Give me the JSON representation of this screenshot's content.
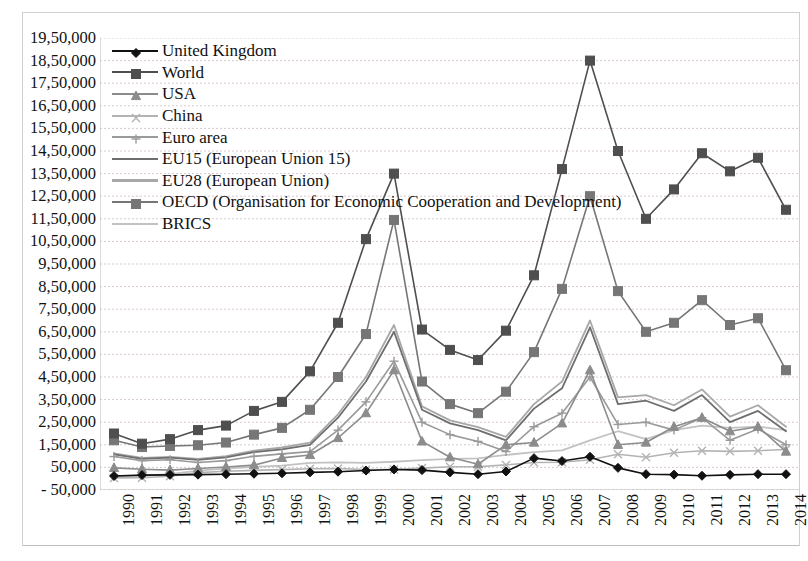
{
  "chart_data": {
    "type": "line",
    "title": "",
    "xlabel": "",
    "ylabel": "",
    "grid": true,
    "legend_position": "top-left-inside",
    "ylim": [
      -50000,
      1950000
    ],
    "ytick_step": 100000,
    "ytick_labels": [
      "19,50,000",
      "18,50,000",
      "17,50,000",
      "16,50,000",
      "15,50,000",
      "14,50,000",
      "13,50,000",
      "12,50,000",
      "11,50,000",
      "10,50,000",
      "9,50,000",
      "8,50,000",
      "7,50,000",
      "6,50,000",
      "5,50,000",
      "4,50,000",
      "3,50,000",
      "2,50,000",
      "1,50,000",
      "50,000",
      "- 50,000"
    ],
    "ytick_values": [
      1950000,
      1850000,
      1750000,
      1650000,
      1550000,
      1450000,
      1350000,
      1250000,
      1150000,
      1050000,
      950000,
      850000,
      750000,
      650000,
      550000,
      450000,
      350000,
      250000,
      150000,
      50000,
      -50000
    ],
    "categories": [
      "1990",
      "1991",
      "1992",
      "1993",
      "1994",
      "1995",
      "1996",
      "1997",
      "1998",
      "1999",
      "2000",
      "2001",
      "2002",
      "2003",
      "2004",
      "2005",
      "2006",
      "2007",
      "2008",
      "2009",
      "2010",
      "2011",
      "2012",
      "2013",
      "2014"
    ],
    "series": [
      {
        "name": "United Kingdom",
        "marker": "diamond",
        "color": "#111111",
        "values": [
          12000,
          16000,
          17000,
          18000,
          20000,
          22000,
          24000,
          28000,
          31000,
          36000,
          41000,
          38000,
          28000,
          20000,
          32000,
          91000,
          78000,
          97000,
          48000,
          20000,
          18000,
          13000,
          17000,
          20000,
          20000
        ]
      },
      {
        "name": "World",
        "marker": "square",
        "color": "#4f4f4f",
        "values": [
          200000,
          155000,
          175000,
          215000,
          235000,
          300000,
          340000,
          475000,
          690000,
          1060000,
          1350000,
          660000,
          570000,
          525000,
          655000,
          900000,
          1370000,
          1850000,
          1450000,
          1150000,
          1280000,
          1440000,
          1360000,
          1420000,
          1190000
        ]
      },
      {
        "name": "USA",
        "marker": "triangle",
        "color": "#8c8c8c",
        "values": [
          48000,
          42000,
          38000,
          45000,
          52000,
          60000,
          92000,
          105000,
          180000,
          290000,
          480000,
          165000,
          95000,
          64000,
          150000,
          160000,
          245000,
          480000,
          150000,
          160000,
          230000,
          270000,
          210000,
          230000,
          120000
        ]
      },
      {
        "name": "China",
        "marker": "x",
        "color": "#b3b3b3",
        "values": [
          3500,
          4400,
          11000,
          27000,
          33000,
          37000,
          40000,
          44000,
          45000,
          40000,
          41000,
          47000,
          53000,
          53000,
          61000,
          72000,
          73000,
          84000,
          108000,
          95000,
          115000,
          124000,
          121000,
          124000,
          129000
        ]
      },
      {
        "name": "Euro area",
        "marker": "plus",
        "color": "#9a9a9a",
        "values": [
          98000,
          80000,
          84000,
          72000,
          80000,
          99000,
          110000,
          120000,
          215000,
          340000,
          520000,
          250000,
          195000,
          165000,
          120000,
          230000,
          290000,
          450000,
          240000,
          250000,
          215000,
          270000,
          170000,
          220000,
          150000
        ]
      },
      {
        "name": "EU15 (European Union 15)",
        "marker": "none",
        "color": "#6e6e6e",
        "values": [
          108000,
          88000,
          93000,
          83000,
          94000,
          118000,
          130000,
          150000,
          270000,
          430000,
          650000,
          305000,
          245000,
          215000,
          170000,
          310000,
          400000,
          670000,
          330000,
          345000,
          300000,
          370000,
          250000,
          300000,
          210000
        ]
      },
      {
        "name": "EU28 (European Union)",
        "marker": "none",
        "color": "#a8a8a8",
        "values": [
          112000,
          92000,
          97000,
          88000,
          100000,
          124000,
          138000,
          160000,
          285000,
          450000,
          680000,
          320000,
          258000,
          228000,
          185000,
          330000,
          430000,
          700000,
          360000,
          370000,
          325000,
          395000,
          275000,
          325000,
          230000
        ]
      },
      {
        "name": "OECD (Organisation for Economic Cooperation and Development)",
        "marker": "square",
        "color": "#767676",
        "values": [
          170000,
          140000,
          145000,
          148000,
          160000,
          195000,
          225000,
          305000,
          450000,
          640000,
          1145000,
          430000,
          330000,
          290000,
          385000,
          560000,
          840000,
          1250000,
          830000,
          650000,
          690000,
          790000,
          680000,
          710000,
          480000
        ]
      },
      {
        "name": "BRICS",
        "marker": "none",
        "color": "#c2c2c2",
        "values": [
          12000,
          13000,
          20000,
          36000,
          45000,
          52000,
          58000,
          70000,
          72000,
          70000,
          75000,
          82000,
          88000,
          90000,
          105000,
          118000,
          125000,
          170000,
          210000,
          175000,
          215000,
          235000,
          225000,
          230000,
          215000
        ]
      }
    ]
  },
  "legend": {
    "items": [
      {
        "label": "United Kingdom"
      },
      {
        "label": "World"
      },
      {
        "label": "USA"
      },
      {
        "label": "China"
      },
      {
        "label": "Euro area"
      },
      {
        "label": "EU15 (European Union 15)"
      },
      {
        "label": "EU28 (European Union)"
      },
      {
        "label": "OECD (Organisation for Economic Cooperation and Development)"
      },
      {
        "label": "BRICS"
      }
    ]
  },
  "colors": {
    "grid": "#d9c9cf",
    "axis": "#b9b9b9",
    "frame": "#cfcfcf",
    "text": "#111111"
  }
}
